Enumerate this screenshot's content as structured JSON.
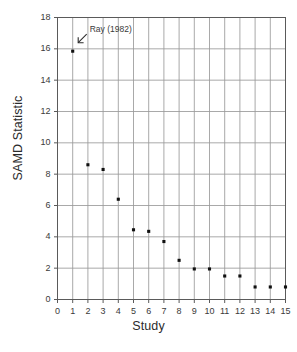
{
  "chart_data": {
    "type": "scatter",
    "title": "",
    "xlabel": "Study",
    "ylabel": "SAMD Statistic",
    "xlim": [
      0,
      15
    ],
    "ylim": [
      0,
      18
    ],
    "grid": true,
    "legend": "none",
    "xticks": [
      "0",
      "1",
      "2",
      "3",
      "4",
      "5",
      "6",
      "7",
      "8",
      "9",
      "10",
      "11",
      "12",
      "13",
      "14",
      "15"
    ],
    "yticks": [
      "0",
      "2",
      "4",
      "6",
      "8",
      "10",
      "12",
      "14",
      "16",
      "18"
    ],
    "x": [
      1,
      2,
      3,
      4,
      5,
      6,
      7,
      8,
      9,
      10,
      11,
      12,
      13,
      14,
      15
    ],
    "values": [
      15.85,
      8.6,
      8.3,
      6.4,
      4.45,
      4.35,
      3.7,
      2.5,
      1.95,
      1.95,
      1.5,
      1.5,
      0.8,
      0.8,
      0.8
    ],
    "marker": "square",
    "marker_color": "#111111",
    "grid_color": "#9a9a9a",
    "axis_color": "#5a5a5a",
    "annotations": [
      {
        "text": "Ray (1982)",
        "x": 1,
        "y": 15.85,
        "arrow": "down-left-arrow-icon"
      }
    ]
  }
}
